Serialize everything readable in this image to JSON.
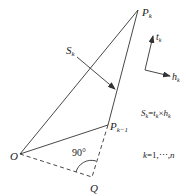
{
  "diagram": {
    "points": {
      "O": {
        "label": "O",
        "x": 20,
        "y": 154
      },
      "P_k": {
        "label": "P",
        "sub": "k",
        "x": 138,
        "y": 10
      },
      "P_k_minus_1": {
        "label": "P",
        "sub": "k−1",
        "x": 108,
        "y": 125
      },
      "Q": {
        "label": "Q",
        "x": 92,
        "y": 177
      }
    },
    "angle_label": "90°",
    "vector": {
      "label": "S",
      "sub": "k"
    },
    "axes": {
      "t": {
        "label": "t",
        "sub": "k"
      },
      "h": {
        "label": "h",
        "sub": "k"
      }
    },
    "formula": {
      "S": "S",
      "S_sub": "k",
      "eq": "=",
      "t": "t",
      "t_sub": "k",
      "times": "×",
      "h": "h",
      "h_sub": "k"
    },
    "range": {
      "text_k": "k",
      "text_rest": "=1,⋯,",
      "text_n": "n"
    },
    "colors": {
      "line": "#333333",
      "text": "#222222"
    }
  }
}
